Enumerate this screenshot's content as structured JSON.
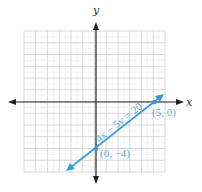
{
  "chart_data": {
    "type": "line",
    "title": "",
    "xlabel": "x",
    "ylabel": "y",
    "xlim": [
      -6,
      6
    ],
    "ylim": [
      -6,
      6
    ],
    "grid": true,
    "minor_grid": true,
    "series": [
      {
        "name": "4x − 5y = 20",
        "equation": "4x − 5y = 20",
        "slope": 0.8,
        "intercept": -4,
        "x_range": [
          -2.4,
          5.7
        ],
        "color": "#3a9ad9"
      }
    ],
    "annotations": [
      {
        "text": "(5, 0)",
        "x": 5,
        "y": 0
      },
      {
        "text": "(0, −4)",
        "x": 0,
        "y": -4
      },
      {
        "text": "4x − 5y = 20",
        "along_line": true
      }
    ],
    "points": [
      {
        "x": 5,
        "y": 0
      },
      {
        "x": 0,
        "y": -4
      }
    ]
  },
  "labels": {
    "x_axis": "x",
    "y_axis": "y",
    "equation": "4x − 5y = 20",
    "point_a": "(5, 0)",
    "point_b": "(0, −4)"
  },
  "colors": {
    "line": "#3a9ad9",
    "label": "#5aaee0",
    "axis": "#222222",
    "grid_major": "#cfcfcf",
    "grid_minor": "#ececec"
  }
}
